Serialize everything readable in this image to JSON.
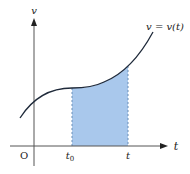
{
  "diagram": {
    "colors": {
      "axis": "#555555",
      "curve": "#1f2a3a",
      "fill": "#a9c8ec",
      "dash": "#6b8fb8",
      "text": "#222222"
    },
    "labels": {
      "y_axis": "v",
      "x_axis": "t",
      "origin": "O",
      "t0_main": "t",
      "t0_sub": "0",
      "t_tick": "t",
      "curve": "v = v(t)"
    }
  }
}
